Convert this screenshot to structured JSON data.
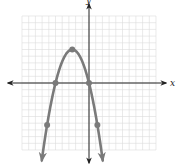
{
  "chart_data": {
    "type": "line",
    "title": "",
    "xlabel": "x",
    "ylabel": "y",
    "xlim": [
      -10,
      10
    ],
    "ylim": [
      -10,
      10
    ],
    "grid": true,
    "grid_step": 1,
    "legend": null,
    "series": [
      {
        "name": "parabola",
        "equation": "y = -0.8x(x+5)",
        "color": "#7a7a7a",
        "marked_points": [
          {
            "x": -6.25,
            "y": -6.25
          },
          {
            "x": -5,
            "y": 0
          },
          {
            "x": -2.5,
            "y": 5
          },
          {
            "x": 0,
            "y": 0
          },
          {
            "x": 1.25,
            "y": -6.25
          }
        ],
        "arrows_at_ends": true
      }
    ]
  },
  "colors": {
    "grid": "#dcdcdc",
    "axis": "#222222",
    "curve": "#7a7a7a"
  }
}
